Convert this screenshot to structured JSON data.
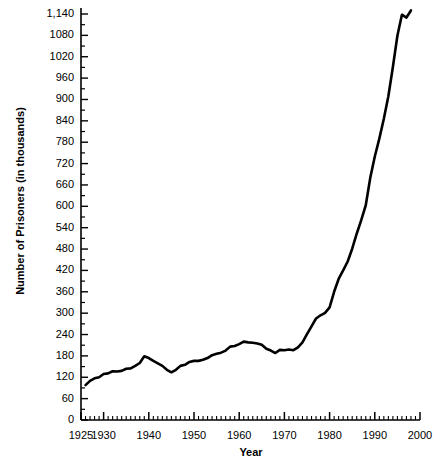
{
  "chart_data": {
    "type": "line",
    "title": "",
    "xlabel": "Year",
    "ylabel": "Number of Prisoners (in thousands)",
    "xlim": [
      1925,
      2000
    ],
    "ylim": [
      0,
      1140
    ],
    "grid": false,
    "legend": "none",
    "xticks": [
      1925,
      1930,
      1940,
      1950,
      1960,
      1970,
      1980,
      1990,
      2000
    ],
    "xtick_labels": [
      "1925",
      "1930",
      "1940",
      "1950",
      "1960",
      "1970",
      "1980",
      "1990",
      "2000"
    ],
    "xtick_minor_interval": 1,
    "yticks": [
      0,
      60,
      120,
      180,
      240,
      300,
      360,
      420,
      480,
      540,
      600,
      660,
      720,
      780,
      840,
      900,
      960,
      1020,
      1080,
      1140
    ],
    "ytick_labels": [
      "0",
      "60",
      "120",
      "180",
      "240",
      "300",
      "360",
      "420",
      "480",
      "540",
      "600",
      "660",
      "720",
      "780",
      "840",
      "900",
      "960",
      "1020",
      "1080",
      "1,140"
    ],
    "line_color": "#000000",
    "line_width": 2.6,
    "x": [
      1926,
      1927,
      1928,
      1929,
      1930,
      1931,
      1932,
      1933,
      1934,
      1935,
      1936,
      1937,
      1938,
      1939,
      1940,
      1941,
      1942,
      1943,
      1944,
      1945,
      1946,
      1947,
      1948,
      1949,
      1950,
      1951,
      1952,
      1953,
      1954,
      1955,
      1956,
      1957,
      1958,
      1959,
      1960,
      1961,
      1962,
      1963,
      1964,
      1965,
      1966,
      1967,
      1968,
      1969,
      1970,
      1971,
      1972,
      1973,
      1974,
      1975,
      1976,
      1977,
      1978,
      1979,
      1980,
      1981,
      1982,
      1983,
      1984,
      1985,
      1986,
      1987,
      1988,
      1989,
      1990,
      1991,
      1992,
      1993,
      1994,
      1995,
      1996,
      1997,
      1998
    ],
    "values": [
      98,
      110,
      117,
      120,
      129,
      131,
      137,
      136,
      138,
      144,
      145,
      152,
      160,
      179,
      174,
      166,
      159,
      152,
      141,
      134,
      141,
      152,
      155,
      163,
      166,
      166,
      169,
      174,
      182,
      186,
      189,
      195,
      206,
      208,
      213,
      220,
      218,
      217,
      215,
      211,
      200,
      195,
      188,
      197,
      196,
      198,
      196,
      204,
      218,
      241,
      263,
      285,
      294,
      301,
      316,
      360,
      396,
      420,
      445,
      481,
      523,
      561,
      603,
      680,
      740,
      790,
      846,
      909,
      991,
      1079,
      1138,
      1130,
      1150
    ],
    "source_note": "",
    "annotations": []
  },
  "axis": {
    "y_title": "Number of Prisoners (in thousands)",
    "x_title": "Year"
  }
}
